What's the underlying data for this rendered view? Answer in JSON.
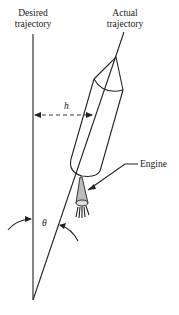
{
  "diagram": {
    "labels": {
      "desired_line1": "Desired",
      "desired_line2": "trajectory",
      "actual_line1": "Actual",
      "actual_line2": "trajectory",
      "h": "h",
      "theta": "θ",
      "engine": "Engine"
    },
    "colors": {
      "line": "#222222",
      "nozzle_fill": "#bbbbbb",
      "background": "#ffffff"
    }
  }
}
